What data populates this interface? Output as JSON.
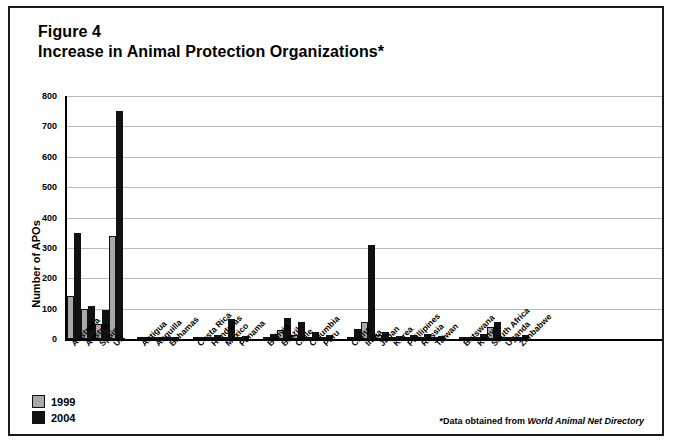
{
  "figure": {
    "title_line1": "Figure 4",
    "title_line2": "Increase in Animal Protection Organizations*",
    "footnote_prefix": "*Data obtained from ",
    "footnote_source": "World Animal Net Directory"
  },
  "legend": {
    "position": "bottom-left",
    "items": [
      {
        "label": "1999",
        "color": "#a8a8a8"
      },
      {
        "label": "2004",
        "color": "#111111"
      }
    ]
  },
  "chart_data": {
    "type": "bar",
    "title": "Increase in Animal Protection Organizations",
    "xlabel": "",
    "ylabel": "Number of APOs",
    "ylim": [
      0,
      800
    ],
    "yticks": [
      0,
      100,
      200,
      300,
      400,
      500,
      600,
      700,
      800
    ],
    "grid": true,
    "legend_position": "bottom-left",
    "categories": [
      "Australia",
      "Austria",
      "Spain",
      "UK",
      "Antigua",
      "Anguilla",
      "Bahamas",
      "Costa Rica",
      "Honduras",
      "Mexico",
      "Panama",
      "Bolivia",
      "Brazil",
      "Chile",
      "Columbia",
      "Peru",
      "China",
      "India",
      "Japan",
      "Korea",
      "Phillipines",
      "Russia",
      "Taiwan",
      "Botswana",
      "Kenya",
      "South Africa",
      "Uganda",
      "Zimbabwe"
    ],
    "group_breaks_after": [
      "UK",
      "Bahamas",
      "Panama",
      "Peru",
      "Taiwan"
    ],
    "series": [
      {
        "name": "1999",
        "color": "#a8a8a8",
        "values": [
          140,
          100,
          50,
          340,
          1,
          0,
          2,
          2,
          3,
          8,
          4,
          6,
          30,
          12,
          8,
          5,
          3,
          55,
          12,
          5,
          4,
          6,
          3,
          2,
          8,
          38,
          4,
          3
        ]
      },
      {
        "name": "2004",
        "color": "#111111",
        "values": [
          350,
          110,
          95,
          750,
          3,
          2,
          4,
          6,
          12,
          65,
          9,
          18,
          70,
          55,
          22,
          13,
          32,
          310,
          22,
          10,
          12,
          18,
          9,
          5,
          16,
          57,
          8,
          12
        ]
      }
    ]
  }
}
